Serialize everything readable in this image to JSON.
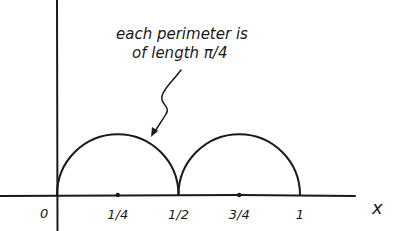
{
  "annotation": {
    "line1": "each perimeter is",
    "line2_prefix": "of length ",
    "line2_value": "π/4"
  },
  "axis": {
    "x_label": "x",
    "origin_label": "0",
    "ticks": [
      {
        "value": 0.25,
        "label": "1/4",
        "dot": true
      },
      {
        "value": 0.5,
        "label": "1/2",
        "dot": false
      },
      {
        "value": 0.75,
        "label": "3/4",
        "dot": true
      },
      {
        "value": 1,
        "label": "1",
        "dot": false
      }
    ]
  },
  "arcs": [
    {
      "from": 0,
      "to": 0.5
    },
    {
      "from": 0.5,
      "to": 1
    }
  ],
  "colors": {
    "ink": "#1a1a1a",
    "background": "#ffffff"
  }
}
